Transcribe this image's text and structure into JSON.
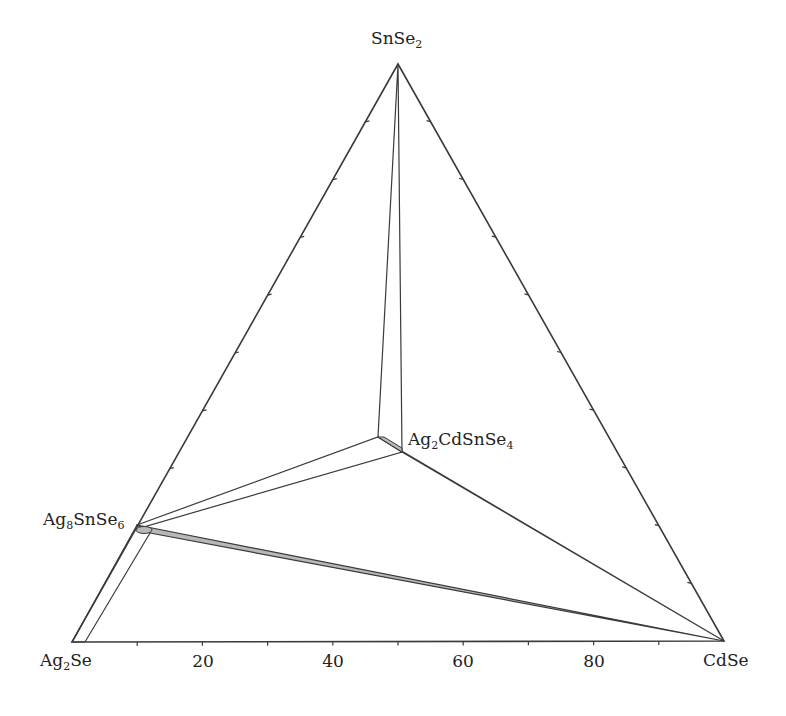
{
  "chart_data": {
    "type": "ternary-phase-diagram",
    "title": "",
    "vertices": {
      "bottom_left": {
        "name": "Ag2Se",
        "base": "Ag",
        "sub": "2",
        "rest": "Se"
      },
      "bottom_right": {
        "name": "CdSe",
        "base": "CdSe",
        "sub": "",
        "rest": ""
      },
      "top": {
        "name": "SnSe2",
        "base": "SnSe",
        "sub": "2",
        "rest": ""
      }
    },
    "bottom_axis": {
      "tick_step": 10,
      "tick_labels": [
        "20",
        "40",
        "60",
        "80"
      ],
      "unit": "mol% CdSe"
    },
    "compounds": [
      {
        "id": "ag8snse6",
        "label_base": "Ag",
        "label_sub1": "8",
        "label_mid": "SnSe",
        "label_sub2": "6",
        "composition": {
          "Ag2Se": 80,
          "CdSe": 0,
          "SnSe2": 20
        }
      },
      {
        "id": "ag2cdsnse4",
        "label_base": "Ag",
        "label_sub1": "2",
        "label_mid": "CdSnSe",
        "label_sub2": "4",
        "composition": {
          "Ag2Se": 33.3,
          "CdSe": 33.3,
          "SnSe2": 33.3
        }
      }
    ],
    "tie_lines": [
      [
        "SnSe2",
        "Ag2CdSnSe4"
      ],
      [
        "Ag8SnSe6",
        "Ag2CdSnSe4"
      ],
      [
        "Ag2CdSnSe4",
        "CdSe"
      ],
      [
        "Ag8SnSe6",
        "CdSe"
      ],
      [
        "Ag2Se",
        "Ag8SnSe6"
      ]
    ],
    "colors": {
      "line": "#3a3a3a",
      "band_fill": "#b8b8b8"
    }
  }
}
